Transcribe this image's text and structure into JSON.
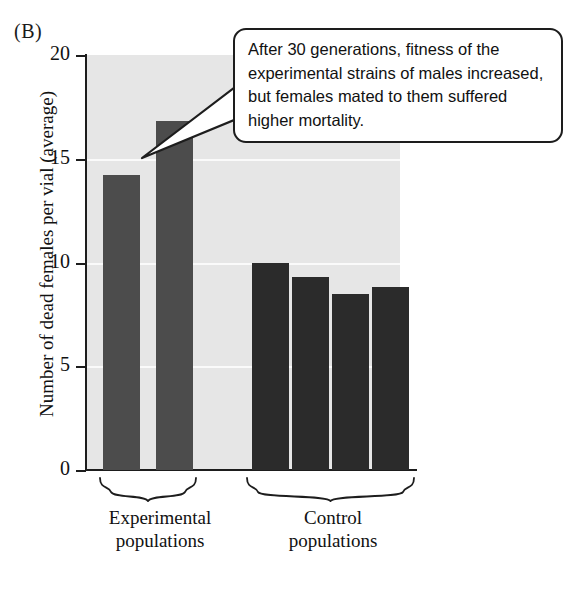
{
  "figure": {
    "panel_label": "(B)",
    "background_color": "#ffffff",
    "plot_background_color": "#e6e6e6",
    "gridline_color": "#fafafa",
    "axis_color": "#1d1d1d"
  },
  "callout": {
    "text": "After 30 generations, fitness of the experimental strains of males increased, but females mated to them suffered higher mortality.",
    "border_color": "#1d1d1d",
    "fill_color": "#ffffff"
  },
  "axis": {
    "y_title": "Number of dead females per vial (average)",
    "y_ticks": [
      "0",
      "5",
      "10",
      "15",
      "20"
    ]
  },
  "groups": [
    {
      "name": "experimental",
      "label_line1": "Experimental",
      "label_line2": "populations",
      "bar_count": 2,
      "color": "#4c4c4c"
    },
    {
      "name": "control",
      "label_line1": "Control",
      "label_line2": "populations",
      "bar_count": 4,
      "color": "#2b2b2b"
    }
  ],
  "chart_data": {
    "type": "bar",
    "title": "",
    "xlabel": "",
    "ylabel": "Number of dead females per vial (average)",
    "ylim": [
      0,
      20
    ],
    "yticks": [
      0,
      5,
      10,
      15,
      20
    ],
    "grid": true,
    "legend": "none",
    "categories": [
      "Experimental 1",
      "Experimental 2",
      "Control 1",
      "Control 2",
      "Control 3",
      "Control 4"
    ],
    "values": [
      14.2,
      16.8,
      10.0,
      9.3,
      8.5,
      8.8
    ],
    "series": [
      {
        "name": "Number of dead females per vial (average)",
        "values": [
          14.2,
          16.8,
          10.0,
          9.3,
          8.5,
          8.8
        ]
      }
    ],
    "group_brackets": [
      {
        "label": "Experimental populations",
        "categories": [
          "Experimental 1",
          "Experimental 2"
        ],
        "bar_color": "#4c4c4c"
      },
      {
        "label": "Control populations",
        "categories": [
          "Control 1",
          "Control 2",
          "Control 3",
          "Control 4"
        ],
        "bar_color": "#2b2b2b"
      }
    ],
    "annotations": [
      {
        "text": "After 30 generations, fitness of the experimental strains of males increased, but females mated to them suffered higher mortality.",
        "points_to": "Experimental 2"
      }
    ]
  }
}
